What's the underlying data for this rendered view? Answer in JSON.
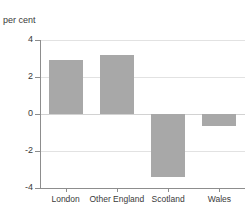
{
  "chart_data": {
    "type": "bar",
    "title": "in major regions of UK",
    "title_note": "first title line cropped above image top edge",
    "categories": [
      "London",
      "Other England",
      "Scotland",
      "Wales"
    ],
    "values": [
      2.9,
      3.2,
      -3.4,
      -0.65
    ],
    "xlabel": "",
    "ylabel": "per cent",
    "ylim": [
      -4,
      4
    ],
    "yticks": [
      4,
      2,
      0,
      -2,
      -4
    ],
    "ytick_labels": [
      "4",
      "2",
      "0",
      "-2",
      "-4"
    ],
    "grid": true,
    "legend": false,
    "series": [
      {
        "name": "per cent change",
        "values": [
          2.9,
          3.2,
          -3.4,
          -0.65
        ]
      }
    ]
  },
  "style": {
    "bar_color": "#a8a8a8",
    "grid_color": "#e2e2e2",
    "axis_color": "#8d8d8d",
    "text_color": "#3a3a3a",
    "background": "#ffffff"
  }
}
